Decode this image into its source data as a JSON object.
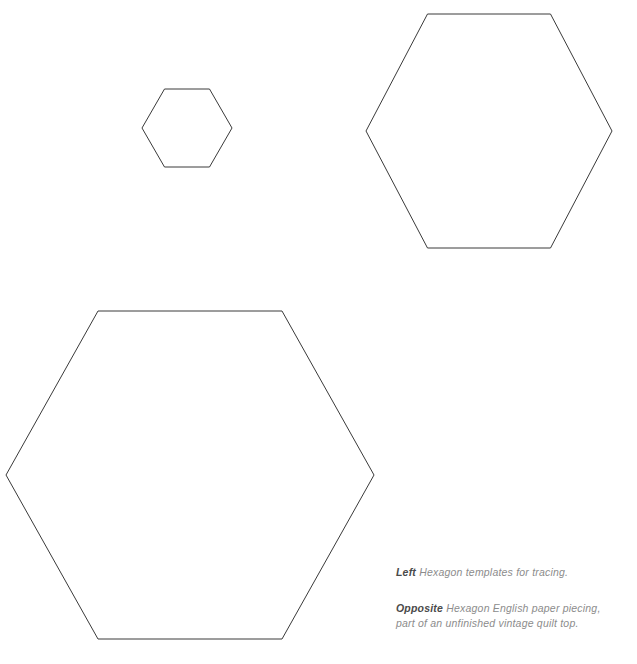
{
  "page": {
    "background_color": "#ffffff",
    "width": 637,
    "height": 664
  },
  "figures": {
    "stroke_color": "#3a3a3a",
    "fill_color": "#ffffff",
    "shapes": [
      {
        "name": "small-hexagon",
        "label": "Small hexagon template",
        "center_x": 187,
        "center_y": 128,
        "radius": 45
      },
      {
        "name": "medium-hexagon",
        "label": "Medium hexagon template",
        "center_x": 489,
        "center_y": 131,
        "radius": 123
      },
      {
        "name": "large-hexagon",
        "label": "Large hexagon template",
        "center_x": 190,
        "center_y": 475,
        "radius": 184
      }
    ]
  },
  "captions": [
    {
      "lead": "Left",
      "lines": [
        "Hexagon templates for tracing."
      ]
    },
    {
      "lead": "Opposite",
      "lines": [
        "Hexagon English paper piecing,",
        "part of an unfinished vintage quilt top."
      ]
    }
  ],
  "caption_color": "#8c8c8c",
  "caption_lead_color": "#4a4a4a"
}
